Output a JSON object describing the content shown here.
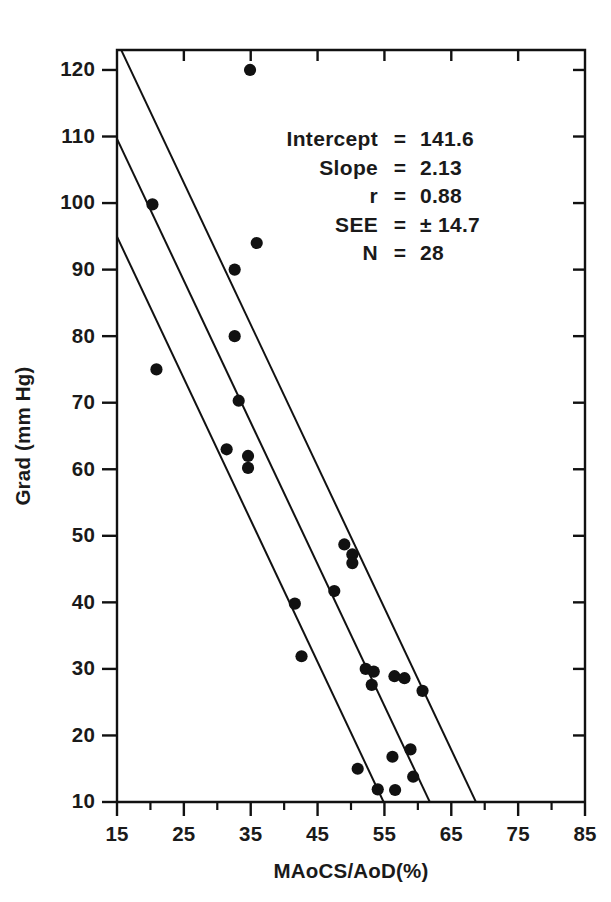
{
  "figure": {
    "background_color": "#ffffff",
    "ink_color": "#111111"
  },
  "chart_data": {
    "type": "scatter",
    "title": "",
    "xlabel": "MAoCS/AoD(%)",
    "ylabel": "Grad (mm Hg)",
    "xlim": [
      15,
      85
    ],
    "ylim": [
      10,
      123
    ],
    "grid": false,
    "legend": null,
    "x_ticks_major": [
      15,
      25,
      35,
      45,
      55,
      65,
      75,
      85
    ],
    "x_ticks_minor": [
      20,
      30,
      40,
      50,
      60,
      70,
      80
    ],
    "x_tick_labels": [
      "15",
      "25",
      "35",
      "45",
      "55",
      "65",
      "75",
      "85"
    ],
    "y_ticks_major": [
      10,
      20,
      30,
      40,
      50,
      60,
      70,
      80,
      90,
      100,
      110,
      120
    ],
    "y_tick_labels": [
      "10",
      "20",
      "30",
      "40",
      "50",
      "60",
      "70",
      "80",
      "90",
      "100",
      "110",
      "120"
    ],
    "points": [
      {
        "x": 34.9,
        "y": 120.0
      },
      {
        "x": 20.3,
        "y": 99.8
      },
      {
        "x": 35.9,
        "y": 94.0
      },
      {
        "x": 32.6,
        "y": 90.0
      },
      {
        "x": 32.6,
        "y": 80.0
      },
      {
        "x": 20.9,
        "y": 75.0
      },
      {
        "x": 33.2,
        "y": 70.3
      },
      {
        "x": 31.4,
        "y": 63.0
      },
      {
        "x": 34.6,
        "y": 62.0
      },
      {
        "x": 34.6,
        "y": 60.2
      },
      {
        "x": 49.0,
        "y": 48.7
      },
      {
        "x": 50.2,
        "y": 47.2
      },
      {
        "x": 50.2,
        "y": 45.9
      },
      {
        "x": 47.5,
        "y": 41.7
      },
      {
        "x": 41.6,
        "y": 39.8
      },
      {
        "x": 52.2,
        "y": 30.0
      },
      {
        "x": 53.4,
        "y": 29.6
      },
      {
        "x": 56.5,
        "y": 28.9
      },
      {
        "x": 58.0,
        "y": 28.6
      },
      {
        "x": 53.1,
        "y": 27.6
      },
      {
        "x": 60.7,
        "y": 26.7
      },
      {
        "x": 42.6,
        "y": 31.9
      },
      {
        "x": 56.2,
        "y": 16.8
      },
      {
        "x": 58.9,
        "y": 17.9
      },
      {
        "x": 51.0,
        "y": 15.0
      },
      {
        "x": 59.3,
        "y": 13.8
      },
      {
        "x": 54.0,
        "y": 11.9
      },
      {
        "x": 56.6,
        "y": 11.8
      }
    ],
    "regression": {
      "intercept": 141.6,
      "slope": -2.13,
      "see": 14.7,
      "lines": [
        {
          "name": "upper-confidence-band",
          "offset": 14.7
        },
        {
          "name": "regression-fit",
          "offset": 0
        },
        {
          "name": "lower-confidence-band",
          "offset": -14.7
        }
      ]
    },
    "annotations": [
      {
        "key": "Intercept",
        "eq": "=",
        "value": "141.6"
      },
      {
        "key": "Slope",
        "eq": "=",
        "value": "2.13"
      },
      {
        "key": "r",
        "eq": "=",
        "value": "0.88"
      },
      {
        "key": "SEE",
        "eq": "=",
        "value": "± 14.7"
      },
      {
        "key": "N",
        "eq": "=",
        "value": "28"
      }
    ]
  }
}
